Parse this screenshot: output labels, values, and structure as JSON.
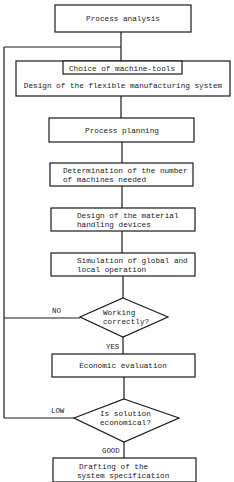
{
  "nodes": {
    "process_analysis": "Process analysis",
    "choice_machine_tools": "Choice of machine-tools",
    "design_fms": "Design of the flexible manufacturing system",
    "process_planning": "Process planning",
    "determination": [
      "Determination of the number",
      "of machines needed"
    ],
    "material_handling": [
      "Design of the material",
      "handling devices"
    ],
    "simulation": [
      "Simulation of global and",
      "local operation"
    ],
    "economic_evaluation": "Economic evaluation",
    "drafting": [
      "Drafting of the",
      "system specification"
    ]
  },
  "decisions": {
    "working_correctly": [
      "Working",
      "correctly?"
    ],
    "is_economical": [
      "Is solution",
      "economical?"
    ]
  },
  "edge_labels": {
    "no": "NO",
    "yes": "YES",
    "low": "LOW",
    "good": "GOOD"
  },
  "edges": [
    {
      "from": "process_analysis",
      "to": "choice_machine_tools"
    },
    {
      "from": "choice_machine_tools",
      "to": "process_planning"
    },
    {
      "from": "process_planning",
      "to": "determination"
    },
    {
      "from": "determination",
      "to": "material_handling"
    },
    {
      "from": "material_handling",
      "to": "simulation"
    },
    {
      "from": "simulation",
      "to": "working_correctly"
    },
    {
      "from": "working_correctly",
      "to": "economic_evaluation",
      "label": "YES"
    },
    {
      "from": "working_correctly",
      "to": "choice_machine_tools",
      "label": "NO"
    },
    {
      "from": "economic_evaluation",
      "to": "is_economical"
    },
    {
      "from": "is_economical",
      "to": "drafting",
      "label": "GOOD"
    },
    {
      "from": "is_economical",
      "to": "choice_machine_tools",
      "label": "LOW"
    }
  ],
  "colors": {
    "line": "#1a1a1a",
    "background": "#ffffff"
  }
}
